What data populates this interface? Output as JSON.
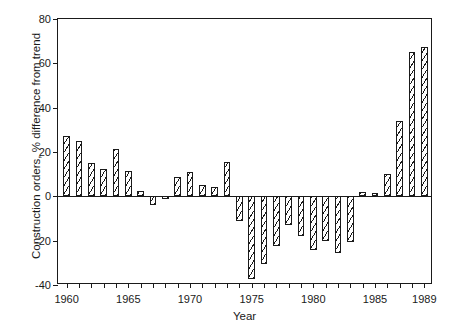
{
  "chart_data": {
    "type": "bar",
    "title": "",
    "xlabel": "Year",
    "ylabel": "Construction orders, % difference from trend",
    "ylim": [
      -40,
      80
    ],
    "xlim": [
      1959.3,
      1989.7
    ],
    "ytick_values": [
      -40,
      -20,
      0,
      20,
      40,
      60,
      80
    ],
    "ytick_labels": [
      "-40",
      "-20",
      "0",
      "20",
      "40",
      "60",
      "80"
    ],
    "xtick_values": [
      1960,
      1961,
      1962,
      1963,
      1964,
      1965,
      1966,
      1967,
      1968,
      1969,
      1970,
      1971,
      1972,
      1973,
      1974,
      1975,
      1976,
      1977,
      1978,
      1979,
      1980,
      1981,
      1982,
      1983,
      1984,
      1985,
      1986,
      1987,
      1988,
      1989
    ],
    "xtick_labeled": [
      1960,
      1965,
      1970,
      1975,
      1980,
      1985,
      1989
    ],
    "xtick_labels": [
      "1960",
      "1965",
      "1970",
      "1975",
      "1980",
      "1985",
      "1989"
    ],
    "grid": false,
    "legend": "none",
    "bar_fill": "white-with-black-diagonal-hatch",
    "bar_edge_color": "#1a1a1a",
    "categories": [
      1960,
      1961,
      1962,
      1963,
      1964,
      1965,
      1966,
      1967,
      1968,
      1969,
      1970,
      1971,
      1972,
      1973,
      1974,
      1975,
      1976,
      1977,
      1978,
      1979,
      1980,
      1981,
      1982,
      1983,
      1984,
      1985,
      1986,
      1987,
      1988,
      1989
    ],
    "values": [
      27,
      25,
      15,
      12.5,
      21.5,
      11.5,
      2.5,
      -4,
      -1,
      8.5,
      11,
      5,
      4,
      15.5,
      -11,
      -37.5,
      -30.5,
      -22.5,
      -13,
      -18,
      -24,
      -20,
      -25.5,
      -20.5,
      2,
      1.5,
      10,
      34,
      65,
      67.5
    ]
  }
}
